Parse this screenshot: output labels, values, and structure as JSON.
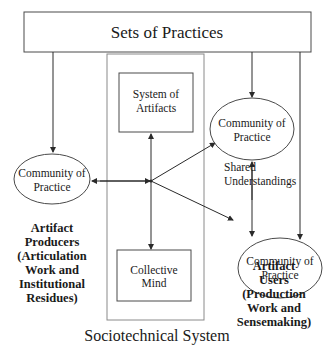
{
  "diagram": {
    "header_box": {
      "label": "Sets of Practices"
    },
    "sociotechnical_system": {
      "caption": "Sociotechnical System",
      "system_of_artifacts": {
        "line1": "System of",
        "line2": "Artifacts"
      },
      "collective_mind": {
        "line1": "Collective",
        "line2": "Mind"
      }
    },
    "communities": {
      "left": {
        "line1": "Community of",
        "line2": "Practice"
      },
      "top_right": {
        "line1": "Community of",
        "line2": "Practice"
      },
      "bottom_right": {
        "line1": "Community of",
        "line2": "Practice"
      }
    },
    "shared_understandings": {
      "line1": "Shared",
      "line2": "Understandings"
    },
    "artifact_producers": {
      "lines": [
        "Artifact",
        "Producers",
        "(Articulation",
        "Work and",
        "Institutional",
        "Residues)"
      ]
    },
    "artifact_users": {
      "lines": [
        "Artifact",
        "Users",
        "(Production",
        "Work and",
        "Sensemaking)"
      ]
    },
    "colors": {
      "line": "#2a2a2a",
      "text": "#1a1a1a",
      "background": "#ffffff"
    }
  }
}
